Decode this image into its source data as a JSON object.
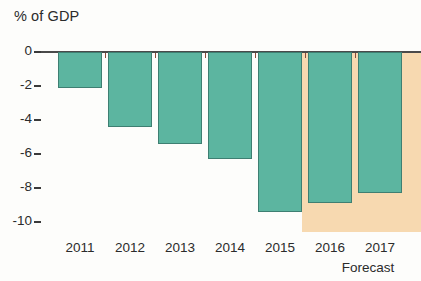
{
  "chart_data": {
    "type": "bar",
    "title": "",
    "ylabel": "% of GDP",
    "xlabel": "",
    "categories": [
      "2011",
      "2012",
      "2013",
      "2014",
      "2015",
      "2016",
      "2017"
    ],
    "values": [
      -2.1,
      -4.4,
      -5.4,
      -6.3,
      -9.4,
      -8.9,
      -8.3
    ],
    "ylim": [
      -10,
      0
    ],
    "yticks": [
      0,
      -2,
      -4,
      -6,
      -8,
      -10
    ],
    "ytick_labels": [
      "0",
      "-2",
      "-4",
      "-6",
      "-8",
      "-10"
    ],
    "grid": false,
    "legend": "none",
    "annotations": [
      {
        "name": "forecast",
        "text": "Forecast",
        "applies_to": [
          "2016",
          "2017"
        ],
        "style": "shaded-band"
      }
    ],
    "colors": {
      "bar_fill": "#5cb5a0",
      "bar_stroke": "#3e7f72",
      "forecast_band": "#f7d9b0",
      "axis": "#4a4a4a",
      "text": "#2b2b2b",
      "background": "#fdfdfb"
    }
  }
}
